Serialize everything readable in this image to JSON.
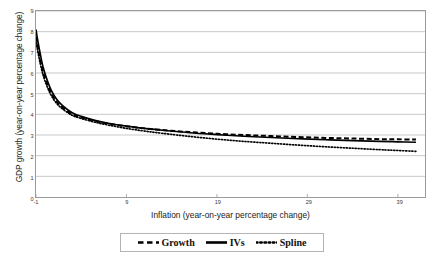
{
  "chart_data": {
    "type": "line",
    "title": "",
    "xlabel": "Inflation (year-on-year percentage change)",
    "ylabel": "GDP growth (year-on-year percentage change)",
    "xlim": [
      -1,
      42
    ],
    "ylim": [
      0,
      9
    ],
    "grid": true,
    "legend_position": "bottom",
    "xticks": [
      -1,
      9,
      19,
      29,
      39
    ],
    "xtick_labels": [
      "-1",
      "9",
      "19",
      "29",
      "39"
    ],
    "yticks": [
      0,
      1,
      2,
      3,
      4,
      5,
      6,
      7,
      8,
      9
    ],
    "ytick_labels": [
      "0",
      "1",
      "2",
      "3",
      "4",
      "5",
      "6",
      "7",
      "8",
      "9"
    ],
    "x": [
      -1,
      -0.8,
      -0.5,
      -0.2,
      0.2,
      0.7,
      1.3,
      2,
      3,
      4,
      5.5,
      7,
      9,
      11,
      13,
      16,
      19,
      22,
      25,
      28,
      31,
      34,
      37,
      39,
      41
    ],
    "series": [
      {
        "name": "Growth",
        "style": "dashed",
        "values": [
          7.75,
          7.2,
          6.55,
          6.0,
          5.5,
          5.0,
          4.6,
          4.3,
          4.0,
          3.85,
          3.68,
          3.55,
          3.42,
          3.32,
          3.24,
          3.14,
          3.06,
          3.0,
          2.95,
          2.9,
          2.86,
          2.83,
          2.8,
          2.79,
          2.78
        ]
      },
      {
        "name": "IVs",
        "style": "solid",
        "values": [
          8.1,
          7.55,
          6.85,
          6.25,
          5.7,
          5.15,
          4.72,
          4.4,
          4.08,
          3.9,
          3.71,
          3.57,
          3.43,
          3.32,
          3.23,
          3.11,
          3.02,
          2.94,
          2.88,
          2.82,
          2.77,
          2.73,
          2.69,
          2.67,
          2.65
        ]
      },
      {
        "name": "Spline",
        "style": "dotted",
        "values": [
          7.6,
          7.05,
          6.4,
          5.88,
          5.38,
          4.9,
          4.52,
          4.24,
          3.95,
          3.8,
          3.62,
          3.48,
          3.32,
          3.19,
          3.08,
          2.93,
          2.8,
          2.69,
          2.6,
          2.51,
          2.43,
          2.36,
          2.29,
          2.25,
          2.21
        ]
      }
    ]
  },
  "legend": {
    "items": [
      {
        "label": "Growth",
        "style": "dashed"
      },
      {
        "label": "IVs",
        "style": "solid"
      },
      {
        "label": "Spline",
        "style": "dotted"
      }
    ]
  }
}
